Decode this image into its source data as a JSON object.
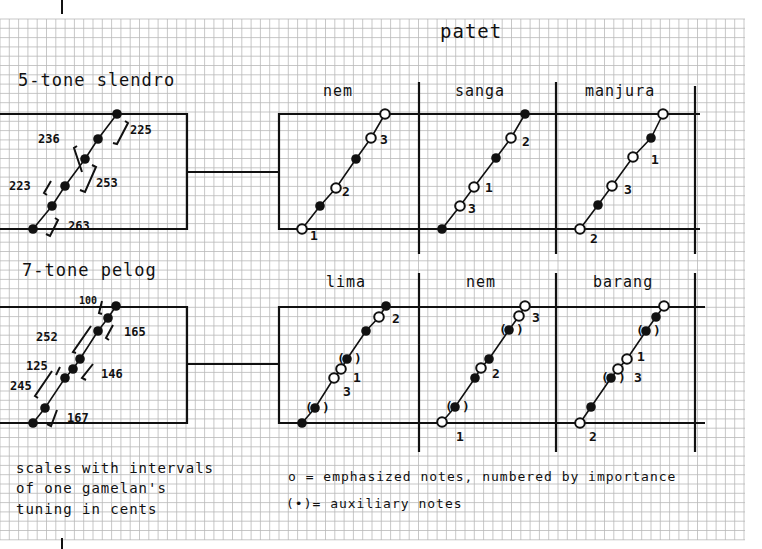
{
  "colors": {
    "paper": "#ffffff",
    "grid_minor": "#b9b9b9",
    "ink": "#111111"
  },
  "grid": {
    "x0": 0,
    "y0": 19,
    "x1": 745,
    "y1": 540,
    "cell": 9.3
  },
  "main_title": "patet",
  "slendro": {
    "title": "5-tone slendro",
    "intervals": [
      "236",
      "225",
      "223",
      "253",
      "263"
    ],
    "patet_panels": [
      {
        "name": "nem",
        "notes": [
          "1 (emphasized)",
          "aux",
          "2 (emphasized)",
          "aux",
          "3 (emphasized)",
          "emphasized"
        ]
      },
      {
        "name": "sanga",
        "notes": [
          "aux",
          "3 (emphasized)",
          "1 (emphasized)",
          "aux",
          "2 (emphasized)",
          "aux"
        ]
      },
      {
        "name": "manjura",
        "notes": [
          "2 (emphasized)",
          "aux",
          "3 (emphasized)",
          "1 (emphasized)",
          "aux",
          "emphasized"
        ]
      }
    ]
  },
  "pelog": {
    "title": "7-tone pelog",
    "intervals": [
      "100",
      "165",
      "252",
      "125",
      "146",
      "245",
      "167"
    ],
    "patet_panels": [
      {
        "name": "lima",
        "notes": [
          "aux",
          "(aux)",
          "3 (emphasized)",
          "1 (emphasized)",
          "(aux)",
          "aux",
          "2 (emphasized)",
          "aux"
        ]
      },
      {
        "name": "nem",
        "notes": [
          "1 (emphasized)",
          "(aux)",
          "aux",
          "2 (emphasized)",
          "aux",
          "(aux)",
          "3 (emphasized)",
          "emphasized"
        ]
      },
      {
        "name": "barang",
        "notes": [
          "2 (emphasized)",
          "aux",
          "(aux)",
          "3 (emphasized)",
          "1 (emphasized)",
          "(aux)",
          "aux",
          "emphasized"
        ]
      }
    ]
  },
  "caption": {
    "line1": "scales with intervals",
    "line2": "of one gamelan's",
    "line3": "tuning in cents"
  },
  "legend": {
    "emphasized": "o = emphasized notes, numbered by importance",
    "auxiliary": "(•)= auxiliary notes"
  },
  "labels": {
    "slendro_nem_nums": [
      "1",
      "2",
      "3"
    ],
    "slendro_sanga_nums": [
      "3",
      "1",
      "2"
    ],
    "slendro_manjura_nums": [
      "2",
      "3",
      "1"
    ],
    "pelog_lima_nums": [
      "3",
      "1",
      "2"
    ],
    "pelog_nem_nums": [
      "1",
      "2",
      "3"
    ],
    "pelog_barang_nums": [
      "2",
      "3",
      "1"
    ]
  }
}
